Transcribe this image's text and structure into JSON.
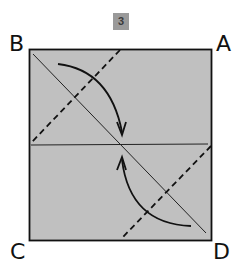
{
  "step_badge": "3",
  "corners": {
    "top_left": "B",
    "top_right": "A",
    "bottom_left": "C",
    "bottom_right": "D"
  },
  "colors": {
    "paper": "#c0c0c0",
    "ink": "#111111",
    "badge": "#9a9a9a"
  },
  "diagram": {
    "type": "origami-fold-step",
    "elements": [
      "square-paper",
      "horizontal-crease",
      "diagonal-crease-B-to-D",
      "valley-fold-dashed-top-left",
      "valley-fold-dashed-bottom-right",
      "fold-arrow-top",
      "fold-arrow-bottom"
    ]
  }
}
